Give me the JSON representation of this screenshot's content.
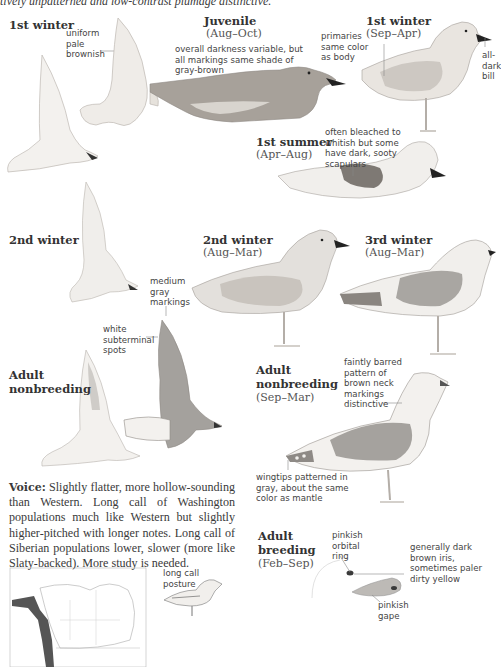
{
  "intro_text": "tively unpatterned and low-contrast plumage distinctive.",
  "plates": {
    "first_winter_flight": {
      "title": "1st winter",
      "notes": [
        "uniform",
        "pale",
        "brownish"
      ]
    },
    "juvenile": {
      "title": "Juvenile",
      "dates": "(Aug–Oct)",
      "notes": [
        "overall darkness variable, but",
        "all markings same shade of",
        "gray-brown"
      ]
    },
    "first_winter_standing": {
      "title": "1st winter",
      "dates": "(Sep–Apr)",
      "note_left": [
        "primaries",
        "same color",
        "as body"
      ],
      "note_right": [
        "all-",
        "dark",
        "bill"
      ]
    },
    "first_summer": {
      "title": "1st summer",
      "dates": "(Apr–Aug)",
      "notes": [
        "often bleached to",
        "whitish but some",
        "have dark, sooty",
        "scapulars"
      ]
    },
    "second_winter_flight": {
      "title": "2nd winter"
    },
    "second_winter_standing": {
      "title": "2nd winter",
      "dates": "(Aug–Mar)"
    },
    "third_winter": {
      "title": "3rd winter",
      "dates": "(Aug–Mar)"
    },
    "adult_nonbreeding_flight": {
      "title_line1": "Adult",
      "title_line2": "nonbreeding",
      "note_top": [
        "medium",
        "gray",
        "markings"
      ],
      "note_mid": [
        "white",
        "subterminal",
        "spots"
      ]
    },
    "adult_nonbreeding_standing": {
      "title_line1": "Adult",
      "title_line2": "nonbreeding",
      "dates": "(Sep–Mar)",
      "note_neck": [
        "faintly barred",
        "pattern of",
        "brown neck",
        "markings",
        "distinctive"
      ],
      "note_wing": [
        "wingtips patterned in",
        "gray, about the same",
        "color as mantle"
      ]
    },
    "adult_breeding": {
      "title_line1": "Adult",
      "title_line2": "breeding",
      "dates": "(Feb–Sep)",
      "note_ring": [
        "pinkish",
        "orbital",
        "ring"
      ],
      "note_iris": [
        "generally dark",
        "brown iris,",
        "sometimes paler",
        "dirty yellow"
      ],
      "note_gape": [
        "pinkish",
        "gape"
      ]
    }
  },
  "voice": {
    "label": "Voice:",
    "text": " Slightly flatter, more hollow-sounding than Western. Long call of Washington populations much like Western but slightly higher-pitched with longer notes. Long call of Siberian populations lower, slower (more like Slaty-backed). More study is needed."
  },
  "long_call": {
    "notes": [
      "long call",
      "posture"
    ]
  },
  "colors": {
    "text": "#3a3a3a",
    "mantle_gray": "#a9a9a9",
    "juvenile_brown": "#9a948c",
    "range_dark": "#555555"
  }
}
